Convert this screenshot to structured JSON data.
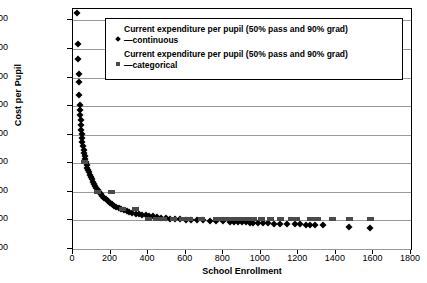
{
  "chart_data": {
    "type": "scatter",
    "title": "",
    "xlabel": "School Enrollment",
    "ylabel": "Cost per Pupil",
    "xlim": [
      0,
      1800
    ],
    "ylim": [
      6000,
      48000
    ],
    "xticks": [
      "0",
      "200",
      "400",
      "600",
      "800",
      "1000",
      "1200",
      "1400",
      "1600",
      "1800"
    ],
    "yticks": [
      "$6,000",
      "$11,000",
      "$16,000",
      "$21,000",
      "$26,000",
      "$31,000",
      "$36,000",
      "$41,000",
      "$46,000"
    ],
    "grid": true,
    "legend_position": "top-center",
    "series": [
      {
        "name": "Current expenditure per pupil (50% pass and 90% grad) —continuous",
        "marker": "diamond",
        "color": "#000000",
        "points": [
          [
            22,
            47300
          ],
          [
            26,
            41800
          ],
          [
            28,
            39300
          ],
          [
            30,
            36600
          ],
          [
            31,
            35300
          ],
          [
            33,
            33000
          ],
          [
            35,
            31200
          ],
          [
            36,
            30300
          ],
          [
            38,
            29400
          ],
          [
            40,
            28600
          ],
          [
            42,
            27700
          ],
          [
            44,
            26900
          ],
          [
            46,
            26200
          ],
          [
            48,
            25500
          ],
          [
            50,
            24800
          ],
          [
            53,
            24100
          ],
          [
            56,
            23400
          ],
          [
            59,
            22800
          ],
          [
            62,
            22200
          ],
          [
            65,
            21700
          ],
          [
            68,
            21200
          ],
          [
            72,
            20700
          ],
          [
            76,
            20200
          ],
          [
            80,
            19800
          ],
          [
            85,
            19400
          ],
          [
            90,
            19000
          ],
          [
            95,
            18600
          ],
          [
            100,
            18200
          ],
          [
            106,
            17800
          ],
          [
            112,
            17400
          ],
          [
            118,
            17000
          ],
          [
            125,
            16600
          ],
          [
            132,
            16300
          ],
          [
            140,
            15900
          ],
          [
            148,
            15600
          ],
          [
            156,
            15300
          ],
          [
            165,
            15000
          ],
          [
            175,
            14700
          ],
          [
            185,
            14400
          ],
          [
            195,
            14100
          ],
          [
            206,
            13900
          ],
          [
            218,
            13600
          ],
          [
            230,
            13400
          ],
          [
            243,
            13200
          ],
          [
            256,
            13000
          ],
          [
            270,
            12800
          ],
          [
            285,
            12650
          ],
          [
            300,
            12500
          ],
          [
            316,
            12350
          ],
          [
            333,
            12200
          ],
          [
            350,
            12100
          ],
          [
            368,
            12000
          ],
          [
            387,
            11900
          ],
          [
            406,
            11800
          ],
          [
            426,
            11700
          ],
          [
            447,
            11600
          ],
          [
            470,
            11500
          ],
          [
            494,
            11400
          ],
          [
            519,
            11300
          ],
          [
            545,
            11250
          ],
          [
            572,
            11200
          ],
          [
            600,
            11150
          ],
          [
            630,
            11100
          ],
          [
            661,
            11050
          ],
          [
            693,
            11000
          ],
          [
            727,
            10950
          ],
          [
            762,
            10900
          ],
          [
            799,
            10850
          ],
          [
            838,
            10800
          ],
          [
            860,
            10750
          ],
          [
            880,
            10700
          ],
          [
            900,
            10680
          ],
          [
            920,
            10650
          ],
          [
            940,
            10620
          ],
          [
            960,
            10600
          ],
          [
            985,
            10560
          ],
          [
            1010,
            10520
          ],
          [
            1040,
            10480
          ],
          [
            1070,
            10450
          ],
          [
            1100,
            10400
          ],
          [
            1140,
            10380
          ],
          [
            1180,
            10350
          ],
          [
            1210,
            10300
          ],
          [
            1240,
            10280
          ],
          [
            1260,
            10260
          ],
          [
            1290,
            10240
          ],
          [
            1330,
            10200
          ],
          [
            1470,
            9800
          ],
          [
            1580,
            9600
          ]
        ]
      },
      {
        "name": "Current expenditure per pupil (50% pass and 90% grad) —categorical",
        "marker": "square",
        "color": "#4a4a4a",
        "points": [
          [
            60,
            21300
          ],
          [
            130,
            16000
          ],
          [
            200,
            16000
          ],
          [
            260,
            13000
          ],
          [
            330,
            13000
          ],
          [
            400,
            11200
          ],
          [
            440,
            11200
          ],
          [
            480,
            11200
          ],
          [
            530,
            11200
          ],
          [
            580,
            11200
          ],
          [
            620,
            11200
          ],
          [
            680,
            11200
          ],
          [
            760,
            11200
          ],
          [
            800,
            11200
          ],
          [
            830,
            11200
          ],
          [
            860,
            11200
          ],
          [
            890,
            11200
          ],
          [
            920,
            11200
          ],
          [
            960,
            11200
          ],
          [
            1000,
            11200
          ],
          [
            1050,
            11200
          ],
          [
            1100,
            11200
          ],
          [
            1160,
            11200
          ],
          [
            1190,
            11200
          ],
          [
            1260,
            11200
          ],
          [
            1300,
            11200
          ],
          [
            1380,
            11200
          ],
          [
            1470,
            11200
          ],
          [
            1580,
            11200
          ]
        ]
      }
    ]
  },
  "legend": {
    "entries": [
      {
        "label_line1": "Current expenditure per pupil (50% pass and 90% grad)",
        "label_line2": "—continuous"
      },
      {
        "label_line1": "Current expenditure per pupil (50% pass and 90% grad)",
        "label_line2": "—categorical"
      }
    ]
  }
}
